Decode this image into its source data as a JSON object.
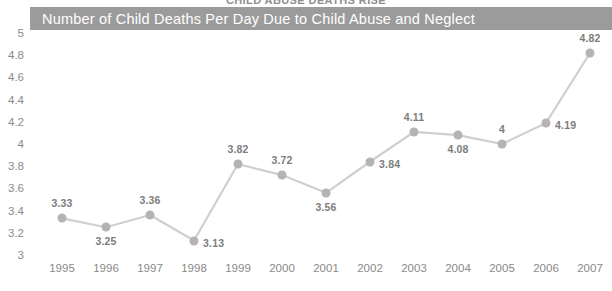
{
  "supertitle": "CHILD ABUSE DEATHS RISE",
  "title": "Number of Child Deaths Per Day Due to Child Abuse and Neglect",
  "colors": {
    "title_bar_bg": "#9b9b9b",
    "title_text": "#ffffff",
    "line": "#cfcfcf",
    "marker": "#b4b4b4",
    "label_text": "#7d7d7d",
    "axis_text": "#8a8a8a",
    "plot_bg": "#ffffff"
  },
  "chart_data": {
    "type": "line",
    "title": "Number of Child Deaths Per Day Due to Child Abuse and Neglect",
    "xlabel": "",
    "ylabel": "",
    "ylim": [
      3,
      5
    ],
    "ytick_step": 0.2,
    "yticks": [
      "5",
      "4.8",
      "4.6",
      "4.4",
      "4.2",
      "4",
      "3.8",
      "3.6",
      "3.4",
      "3.2",
      "3"
    ],
    "ytick_values": [
      5,
      4.8,
      4.6,
      4.4,
      4.2,
      4,
      3.8,
      3.6,
      3.4,
      3.2,
      3
    ],
    "grid": false,
    "legend": "none",
    "categories": [
      "1995",
      "1996",
      "1997",
      "1998",
      "1999",
      "2000",
      "2001",
      "2002",
      "2003",
      "2004",
      "2005",
      "2006",
      "2007"
    ],
    "values": [
      3.33,
      3.25,
      3.36,
      3.13,
      3.82,
      3.72,
      3.56,
      3.84,
      4.11,
      4.08,
      4,
      4.19,
      4.82
    ],
    "point_labels": [
      "3.33",
      "3.25",
      "3.36",
      "3.13",
      "3.82",
      "3.72",
      "3.56",
      "3.84",
      "4.11",
      "4.08",
      "4",
      "4.19",
      "4.82"
    ],
    "label_positions": [
      "above",
      "below",
      "above",
      "right",
      "above",
      "above",
      "below",
      "right",
      "above",
      "below",
      "above",
      "right",
      "above"
    ]
  }
}
